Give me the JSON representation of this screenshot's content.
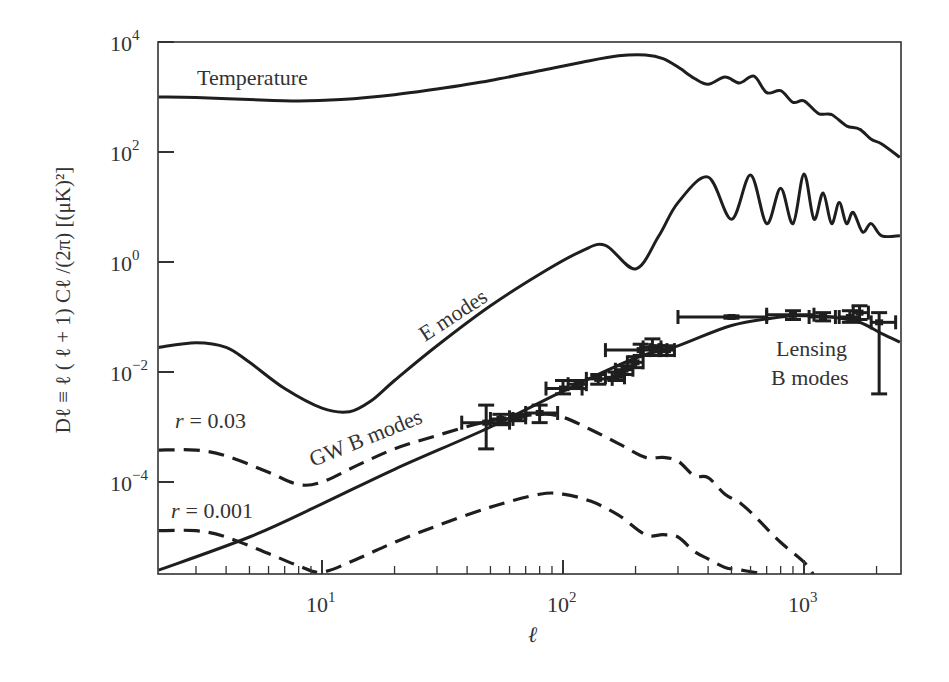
{
  "chart_data": {
    "type": "line",
    "title": "",
    "xlabel": "ℓ",
    "ylabel": "Dℓ ≡ ℓ ( ℓ + 1) Cℓ /(2π) [(μK)²]",
    "xscale": "log",
    "yscale": "log",
    "xlim": [
      2.1,
      2500
    ],
    "ylim": [
      2.1e-06,
      10000
    ],
    "grid": false,
    "x_ticks": [
      {
        "value": 10,
        "label": "10",
        "exp": "1"
      },
      {
        "value": 100,
        "label": "10",
        "exp": "2"
      },
      {
        "value": 1000,
        "label": "10",
        "exp": "3"
      }
    ],
    "y_ticks": [
      {
        "value": 10000,
        "label": "10",
        "exp": "4"
      },
      {
        "value": 100,
        "label": "10",
        "exp": "2"
      },
      {
        "value": 1,
        "label": "10",
        "exp": "0"
      },
      {
        "value": 0.01,
        "label": "10",
        "exp": "−2"
      },
      {
        "value": 0.0001,
        "label": "10",
        "exp": "−4"
      }
    ],
    "series": [
      {
        "name": "Temperature",
        "style": "solid",
        "x": [
          2.1,
          3,
          5,
          8,
          12,
          20,
          30,
          50,
          80,
          120,
          170,
          220,
          260,
          300,
          350,
          400,
          470,
          540,
          620,
          700,
          800,
          900,
          1000,
          1150,
          1300,
          1500,
          1700,
          1900,
          2100,
          2500
        ],
        "y": [
          1000,
          980,
          900,
          850,
          900,
          1100,
          1400,
          2000,
          3000,
          4300,
          5600,
          5800,
          5000,
          3500,
          2200,
          1700,
          2300,
          1800,
          2400,
          1200,
          1300,
          800,
          850,
          500,
          480,
          300,
          260,
          170,
          140,
          80
        ]
      },
      {
        "name": "E modes",
        "style": "solid",
        "x": [
          2.1,
          3,
          4,
          5,
          7,
          10,
          13,
          16,
          20,
          30,
          50,
          80,
          120,
          150,
          200,
          250,
          300,
          400,
          500,
          600,
          700,
          800,
          900,
          1000,
          1100,
          1200,
          1300,
          1400,
          1500,
          1600,
          1750,
          1900,
          2100,
          2500
        ],
        "y": [
          0.028,
          0.034,
          0.028,
          0.015,
          0.005,
          0.0022,
          0.0019,
          0.003,
          0.007,
          0.03,
          0.16,
          0.6,
          1.6,
          2.0,
          0.75,
          3,
          12,
          35,
          6,
          38,
          5,
          22,
          5,
          40,
          6,
          18,
          5,
          12,
          5,
          8,
          3.5,
          5,
          3,
          3
        ]
      },
      {
        "name": "Lensing B modes",
        "style": "solid",
        "x": [
          2.1,
          5,
          10,
          20,
          50,
          100,
          200,
          300,
          500,
          800,
          1000,
          1300,
          1700,
          2100,
          2500
        ],
        "y": [
          2.5e-06,
          1e-05,
          4e-05,
          0.00017,
          0.001,
          0.0045,
          0.018,
          0.03,
          0.07,
          0.1,
          0.105,
          0.1,
          0.08,
          0.05,
          0.035
        ]
      },
      {
        "name": "GW B modes (r = 0.03)",
        "style": "dashed",
        "x": [
          2.1,
          3,
          4,
          6,
          8,
          10,
          14,
          20,
          30,
          50,
          80,
          100,
          130,
          170,
          220,
          260,
          300,
          350,
          400,
          470,
          550,
          650,
          800,
          1000,
          1100
        ],
        "y": [
          0.00038,
          0.00038,
          0.0003,
          0.00015,
          9e-05,
          0.0001,
          0.0002,
          0.0004,
          0.0007,
          0.0013,
          0.0017,
          0.0015,
          0.0009,
          0.0005,
          0.00028,
          0.00028,
          0.00024,
          0.00013,
          0.00012,
          6e-05,
          4e-05,
          2e-05,
          8e-06,
          3.5e-06,
          2e-06
        ]
      },
      {
        "name": "GW B modes (r = 0.001)",
        "style": "dashed",
        "x": [
          2.1,
          3,
          4,
          6,
          8,
          10,
          14,
          20,
          30,
          50,
          80,
          100,
          130,
          170,
          220,
          260,
          300,
          350,
          400,
          470,
          550,
          650,
          700
        ],
        "y": [
          1.3e-05,
          1.3e-05,
          1e-05,
          5e-06,
          3e-06,
          2.3e-06,
          4e-06,
          8e-06,
          1.6e-05,
          3.5e-05,
          6e-05,
          6e-05,
          4.5e-05,
          2.5e-05,
          1.1e-05,
          1.1e-05,
          1e-05,
          5.5e-06,
          4e-06,
          2.8e-06,
          2.5e-06,
          2.2e-06,
          2.1e-06
        ]
      }
    ],
    "data_points": {
      "name": "B-mode measurements",
      "points": [
        {
          "x": 48,
          "y": 0.0012,
          "xerr": [
            38,
            60
          ],
          "yerr": [
            0.0004,
            0.0025
          ]
        },
        {
          "x": 55,
          "y": 0.0014,
          "xerr": [
            50,
            62
          ],
          "yerr": [
            0.0011,
            0.0017
          ]
        },
        {
          "x": 65,
          "y": 0.0015,
          "xerr": [
            60,
            70
          ],
          "yerr": [
            0.0013,
            0.0017
          ]
        },
        {
          "x": 80,
          "y": 0.0018,
          "xerr": [
            70,
            95
          ],
          "yerr": [
            0.0012,
            0.0025
          ]
        },
        {
          "x": 100,
          "y": 0.005,
          "xerr": [
            85,
            120
          ],
          "yerr": [
            0.004,
            0.007
          ]
        },
        {
          "x": 115,
          "y": 0.006,
          "xerr": [
            105,
            125
          ],
          "yerr": [
            0.005,
            0.007
          ]
        },
        {
          "x": 140,
          "y": 0.0075,
          "xerr": [
            125,
            160
          ],
          "yerr": [
            0.006,
            0.009
          ]
        },
        {
          "x": 165,
          "y": 0.008,
          "xerr": [
            150,
            180
          ],
          "yerr": [
            0.007,
            0.01
          ]
        },
        {
          "x": 180,
          "y": 0.011,
          "xerr": [
            165,
            195
          ],
          "yerr": [
            0.009,
            0.013
          ]
        },
        {
          "x": 200,
          "y": 0.015,
          "xerr": [
            185,
            215
          ],
          "yerr": [
            0.012,
            0.019
          ]
        },
        {
          "x": 210,
          "y": 0.025,
          "xerr": [
            150,
            250
          ],
          "yerr": [
            0.02,
            0.032
          ]
        },
        {
          "x": 235,
          "y": 0.028,
          "xerr": [
            215,
            255
          ],
          "yerr": [
            0.02,
            0.04
          ]
        },
        {
          "x": 250,
          "y": 0.025,
          "xerr": [
            230,
            270
          ],
          "yerr": [
            0.02,
            0.03
          ]
        },
        {
          "x": 270,
          "y": 0.025,
          "xerr": [
            255,
            290
          ],
          "yerr": [
            0.02,
            0.03
          ]
        },
        {
          "x": 500,
          "y": 0.1,
          "xerr": [
            300,
            700
          ],
          "yerr": [
            0.095,
            0.105
          ]
        },
        {
          "x": 900,
          "y": 0.11,
          "xerr": [
            700,
            1100
          ],
          "yerr": [
            0.09,
            0.13
          ]
        },
        {
          "x": 1200,
          "y": 0.1,
          "xerr": [
            1050,
            1350
          ],
          "yerr": [
            0.085,
            0.12
          ]
        },
        {
          "x": 1550,
          "y": 0.1,
          "xerr": [
            1400,
            1700
          ],
          "yerr": [
            0.08,
            0.13
          ]
        },
        {
          "x": 1700,
          "y": 0.12,
          "xerr": [
            1600,
            1850
          ],
          "yerr": [
            0.09,
            0.16
          ]
        },
        {
          "x": 2050,
          "y": 0.08,
          "xerr": [
            1900,
            2400
          ],
          "yerr": [
            0.004,
            0.12
          ]
        }
      ]
    },
    "annotations": [
      {
        "text": "Temperature",
        "x": 3.1,
        "y": 2000
      },
      {
        "text": "E modes",
        "x": 30,
        "y": 0.05,
        "rotation": -33
      },
      {
        "text": "GW B modes",
        "x": 17,
        "y": 0.00017,
        "rotation": -22
      },
      {
        "text": "r = 0.03",
        "x": 2.2,
        "y": 0.0007
      },
      {
        "text": "r = 0.001",
        "x": 2.2,
        "y": 2.5e-05
      },
      {
        "text": "Lensing",
        "x": 1200,
        "y": 0.015
      },
      {
        "text": "B modes",
        "x": 1200,
        "y": 0.0055
      }
    ]
  },
  "labels": {
    "temperature": "Temperature",
    "e_modes": "E modes",
    "gw_b_modes": "GW B modes",
    "r_003": "= 0.03",
    "r_0001": "= 0.001",
    "r_symbol": "r",
    "lensing_1": "Lensing",
    "lensing_2": "B modes",
    "xlabel": "ℓ",
    "ylabel": "Dℓ ≡ ℓ ( ℓ + 1) Cℓ /(2π) [(μK)²]"
  }
}
